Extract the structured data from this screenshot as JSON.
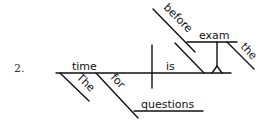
{
  "diagram": {
    "number": "2.",
    "type": "sentence-diagram",
    "words": {
      "subject": "time",
      "verb": "is",
      "subject_modifier_article": "The",
      "preposition": "for",
      "object_of_preposition": "questions",
      "predicate_preposition": "before",
      "predicate_object": "exam",
      "predicate_object_article": "the"
    }
  }
}
